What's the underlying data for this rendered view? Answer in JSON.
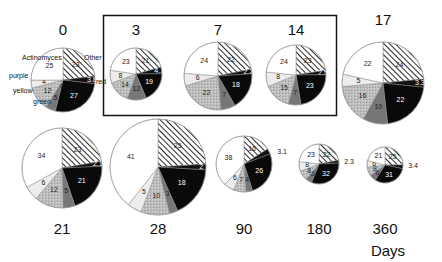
{
  "chart_data": {
    "type": "pie",
    "title": "",
    "xlabel": "Days",
    "categories": [
      "Actinomyces",
      "Other",
      "red",
      "orange",
      "green",
      "yellow",
      "purple"
    ],
    "category_fills": {
      "Actinomyces": "#ffffff",
      "Other": "hatch",
      "red": "#111111",
      "orange": "#0a0a0a",
      "green": "#777777",
      "yellow": "#bdbdbd",
      "purple": "#ececec"
    },
    "highlight_box": {
      "days": [
        "3",
        "7",
        "14"
      ]
    },
    "series": [
      {
        "day": "0",
        "values": {
          "Actinomyces": 25,
          "Other": 23,
          "red": 3.8,
          "orange": 27,
          "green": 5,
          "yellow": 12,
          "purple": 4
        },
        "cx": 63,
        "cy": 80,
        "r": 32,
        "label_y": 35
      },
      {
        "day": "3",
        "values": {
          "Actinomyces": 23,
          "Other": 21,
          "red": 4.1,
          "orange": 19,
          "green": 12,
          "yellow": 14,
          "purple": 8
        },
        "cx": 136,
        "cy": 74,
        "r": 26,
        "label_y": 35
      },
      {
        "day": "7",
        "values": {
          "Actinomyces": 24,
          "Other": 22,
          "red": 2.2,
          "orange": 18,
          "green": 7,
          "yellow": 22,
          "purple": 6
        },
        "cx": 218,
        "cy": 76,
        "r": 34,
        "label_y": 35
      },
      {
        "day": "14",
        "values": {
          "Actinomyces": 24,
          "Other": 23,
          "red": 2.5,
          "orange": 23,
          "green": 7,
          "yellow": 15,
          "purple": 8
        },
        "cx": 296,
        "cy": 75,
        "r": 30,
        "label_y": 35
      },
      {
        "day": "17",
        "values": {
          "Actinomyces": 22,
          "Other": 24,
          "red": 3.3,
          "orange": 22,
          "green": 10,
          "yellow": 16,
          "purple": 5
        },
        "cx": 383,
        "cy": 83,
        "r": 41,
        "label_y": 25
      },
      {
        "day": "21",
        "values": {
          "Actinomyces": 34,
          "Other": 23,
          "red": 2.1,
          "orange": 21,
          "green": 5,
          "yellow": 12,
          "purple": 6
        },
        "cx": 62,
        "cy": 168,
        "r": 40,
        "label_y": 234
      },
      {
        "day": "28",
        "values": {
          "Actinomyces": 41,
          "Other": 25,
          "red": 2.0,
          "orange": 18,
          "green": 3,
          "yellow": 10,
          "purple": 5
        },
        "cx": 158,
        "cy": 167,
        "r": 48,
        "label_y": 234
      },
      {
        "day": "90",
        "values": {
          "Actinomyces": 38,
          "Other": 16,
          "red": 3.1,
          "orange": 26,
          "green": 4,
          "yellow": 7,
          "purple": 6
        },
        "cx": 244,
        "cy": 164,
        "r": 28,
        "label_y": 234
      },
      {
        "day": "180",
        "values": {
          "Actinomyces": 23,
          "Other": 22,
          "red": 2.3,
          "orange": 32,
          "green": 5,
          "yellow": 8,
          "purple": 8
        },
        "cx": 319,
        "cy": 164,
        "r": 20,
        "label_y": 234
      },
      {
        "day": "360",
        "values": {
          "Actinomyces": 21,
          "Other": 25,
          "red": 3.4,
          "orange": 31,
          "green": 6,
          "yellow": 8,
          "purple": 6
        },
        "cx": 385,
        "cy": 165,
        "r": 18,
        "label_y": 234
      }
    ],
    "legend": [
      {
        "text": "Actinomyces",
        "x": 22,
        "y": 60
      },
      {
        "text": "Other",
        "x": 84,
        "y": 60
      },
      {
        "text": "red",
        "x": 96,
        "y": 84
      },
      {
        "text": "purple",
        "x": 9,
        "y": 78
      },
      {
        "text": "yellow",
        "x": 13,
        "y": 93
      },
      {
        "text": "green",
        "x": 33,
        "y": 104
      },
      {
        "text": "orange",
        "x": 60,
        "y": 88
      }
    ],
    "axis_label": {
      "text": "Days",
      "x": 388,
      "y": 256
    }
  }
}
